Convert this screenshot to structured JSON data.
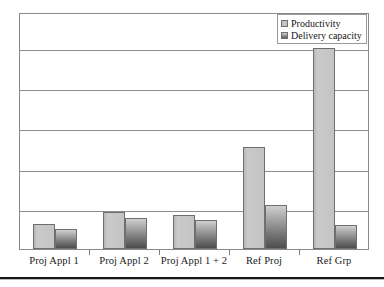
{
  "chart_data": {
    "type": "bar",
    "title": "",
    "xlabel": "",
    "ylabel": "",
    "grid": true,
    "legend_position": "top-right",
    "ylim": [
      0,
      5.9
    ],
    "gridline_values": [
      1,
      2,
      3,
      4,
      5
    ],
    "categories": [
      "Proj Appl 1",
      "Proj Appl 2",
      "Proj Appl 1 + 2",
      "Ref Proj",
      "Ref Grp"
    ],
    "series": [
      {
        "name": "Productivity",
        "color": "#c3c3c3",
        "values": [
          0.62,
          0.92,
          0.85,
          2.55,
          5.0
        ]
      },
      {
        "name": "Delivery capacity",
        "color": "#8f8f8f",
        "values": [
          0.5,
          0.78,
          0.73,
          1.1,
          0.59
        ]
      }
    ]
  },
  "legend": {
    "items": [
      {
        "label": "Productivity"
      },
      {
        "label": "Delivery capacity"
      }
    ]
  },
  "axis": {
    "tick_labels": [
      "Proj Appl 1",
      "Proj Appl 2",
      "Proj Appl 1 + 2",
      "Ref Proj",
      "Ref Grp"
    ]
  }
}
